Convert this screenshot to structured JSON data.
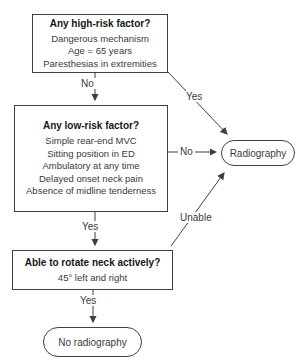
{
  "high_risk_box": {
    "title": "Any high-risk factor?",
    "items": [
      "Dangerous mechanism",
      "Age = 65 years",
      "Paresthesias in extremities"
    ]
  },
  "low_risk_box": {
    "title": "Any low-risk factor?",
    "items": [
      "Simple rear-end MVC",
      "Sitting position in ED",
      "Ambulatory at any time",
      "Delayed onset neck pain",
      "Absence of midline tenderness"
    ]
  },
  "rotate_box": {
    "title": "Able to rotate neck actively?",
    "items": [
      "45° left and right"
    ]
  },
  "radiography_oval": {
    "label": "Radiography"
  },
  "no_radiography_oval": {
    "label": "No radiography"
  },
  "edge_labels": {
    "no_high_risk": "No",
    "yes_high_risk": "Yes",
    "no_low_risk": "No",
    "unable": "Unable",
    "yes_low_risk": "Yes",
    "yes_rotate": "Yes"
  },
  "colors": {
    "line": "#404040",
    "text": "#3a3a3a",
    "title": "#161616",
    "bg": "#ffffff"
  }
}
